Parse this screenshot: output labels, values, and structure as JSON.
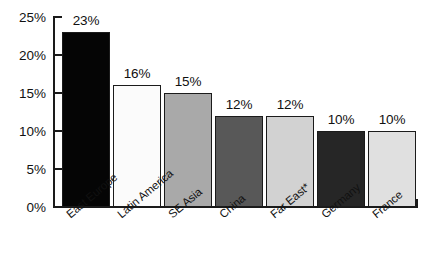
{
  "chart_data": {
    "type": "bar",
    "title": "",
    "subtitle": "",
    "xlabel": "",
    "ylabel": "",
    "ylim": [
      0,
      25
    ],
    "ytick_labels": [
      "0%",
      "5%",
      "10%",
      "15%",
      "20%",
      "25%"
    ],
    "ytick_values": [
      0,
      5,
      10,
      15,
      20,
      25
    ],
    "grid": false,
    "legend": false,
    "categories": [
      "East Europe",
      "Latin America",
      "SE Asia",
      "China",
      "Far East*",
      "Germany",
      "France"
    ],
    "values": [
      23,
      16,
      15,
      12,
      12,
      10,
      10
    ],
    "value_labels": [
      "23%",
      "16%",
      "15%",
      "12%",
      "12%",
      "10%",
      "10%"
    ],
    "bar_colors": [
      "#050505",
      "#fbfbfb",
      "#a9a9a9",
      "#585858",
      "#d2d2d2",
      "#262626",
      "#e0e0e0"
    ],
    "bar_edge_color": "#1b1b1b",
    "background_color": "#ffffff",
    "axis_color": "#1a1a1a",
    "text_color": "#111111"
  }
}
